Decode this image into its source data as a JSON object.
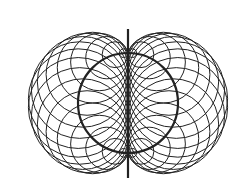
{
  "diagram": {
    "type": "nephroid-circle-envelope",
    "center": [
      128,
      103
    ],
    "base_radius": 50,
    "circle_count": 36,
    "axis": {
      "x": 128,
      "y1": 29,
      "y2": 178
    },
    "stroke_color": "#222222",
    "background": "#ffffff"
  }
}
